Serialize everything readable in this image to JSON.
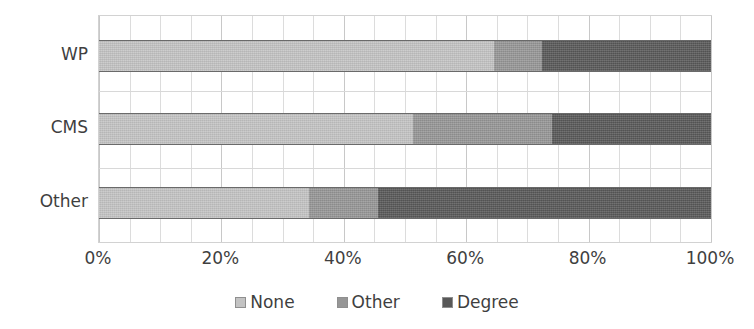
{
  "chart_data": {
    "type": "bar",
    "orientation": "horizontal",
    "stacked": true,
    "normalized": true,
    "title": "",
    "subtitle": "",
    "xlabel": "",
    "ylabel": "",
    "categories": [
      "WP",
      "CMS",
      "Other"
    ],
    "series": [
      {
        "name": "None",
        "color": "#c3c3c3",
        "values": [
          64.5,
          51.3,
          34.3
        ]
      },
      {
        "name": "Other",
        "color": "#969696",
        "values": [
          7.9,
          22.7,
          11.3
        ]
      },
      {
        "name": "Degree",
        "color": "#585858",
        "values": [
          27.6,
          26.0,
          54.4
        ]
      }
    ],
    "xlim": [
      0,
      100
    ],
    "xticks": [
      0,
      20,
      40,
      60,
      80,
      100
    ],
    "xtick_labels": [
      "0%",
      "20%",
      "40%",
      "60%",
      "80%",
      "100%"
    ],
    "grid": {
      "vertical": true,
      "vertical_minor_step": 5,
      "horizontal": true
    },
    "legend": {
      "position": "bottom",
      "entries": [
        "None",
        "Other",
        "Degree"
      ]
    },
    "plot_background": "#ffffff",
    "grid_color": "#dcdcdc",
    "text_color": "#3f3f3f"
  },
  "axis": {
    "y_categories": [
      "WP",
      "CMS",
      "Other"
    ],
    "x_ticks": [
      "0%",
      "20%",
      "40%",
      "60%",
      "80%",
      "100%"
    ]
  },
  "legend": {
    "items": [
      {
        "label": "None",
        "color": "#c3c3c3"
      },
      {
        "label": "Other",
        "color": "#969696"
      },
      {
        "label": "Degree",
        "color": "#585858"
      }
    ]
  }
}
